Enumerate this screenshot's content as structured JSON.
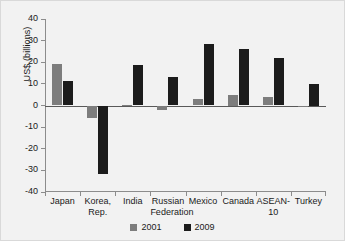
{
  "chart_data": {
    "type": "bar",
    "title": "",
    "subtitle": "",
    "xlabel": "",
    "ylabel": "US$ (billions)",
    "ylim": [
      -40,
      40
    ],
    "ytick_labels": [
      "40",
      "30",
      "20",
      "10",
      "0",
      "-10",
      "-20",
      "-30",
      "-40"
    ],
    "ytick_values": [
      40,
      30,
      20,
      10,
      0,
      -10,
      -20,
      -30,
      -40
    ],
    "grid": false,
    "legend_position": "bottom-center",
    "categories": [
      "Japan",
      "Korea,\nRep.",
      "India",
      "Russian\nFederation",
      "Mexico",
      "Canada",
      "ASEAN-10",
      "Turkey"
    ],
    "series": [
      {
        "name": "2001",
        "color": "#7d7d7d",
        "values": [
          19,
          -6,
          0.3,
          -2,
          3,
          5,
          4,
          -0.5
        ]
      },
      {
        "name": "2009",
        "color": "#1c1c1c",
        "values": [
          11.5,
          -31.5,
          18.5,
          13,
          28.5,
          26,
          22,
          10
        ]
      }
    ]
  }
}
